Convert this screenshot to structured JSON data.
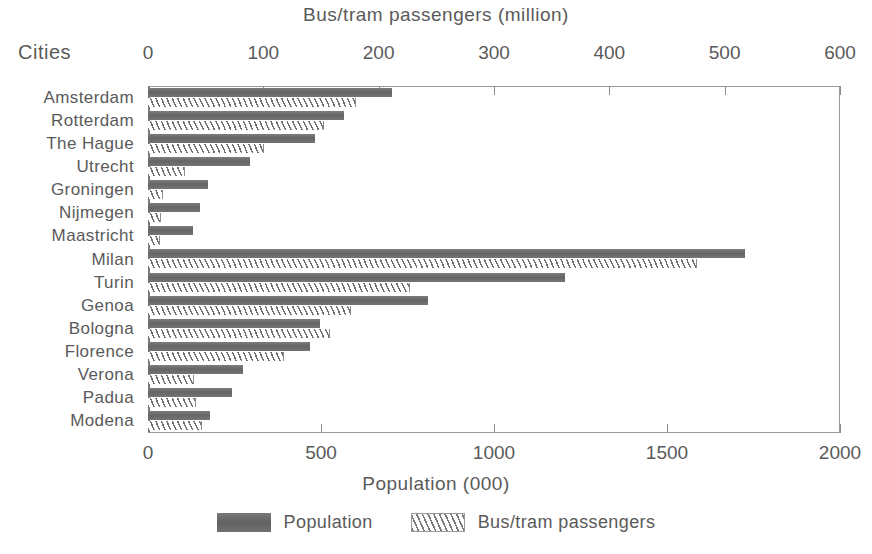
{
  "chart_data": {
    "type": "bar",
    "orientation": "horizontal",
    "title": "Bus/tram passengers (million)",
    "xlabel": "Population (000)",
    "ylabel": "Cities",
    "top_axis": {
      "label": "Bus/tram passengers (million)",
      "ticks": [
        0,
        100,
        200,
        300,
        400,
        500,
        600
      ],
      "tick_labels": [
        "0",
        "100",
        "200",
        "300",
        "400",
        "500",
        "600"
      ],
      "range": [
        0,
        600
      ]
    },
    "bottom_axis": {
      "label": "Population (000)",
      "ticks": [
        0,
        500,
        1000,
        1500,
        2000
      ],
      "tick_labels": [
        "0",
        "500",
        "1000",
        "1500",
        "2000"
      ],
      "range": [
        0,
        2000
      ]
    },
    "categories": [
      "Amsterdam",
      "Rotterdam",
      "The Hague",
      "Utrecht",
      "Groningen",
      "Nijmegen",
      "Maastricht",
      "Milan",
      "Turin",
      "Genoa",
      "Bologna",
      "Florence",
      "Verona",
      "Padua",
      "Modena"
    ],
    "series": [
      {
        "name": "Population",
        "axis": "bottom",
        "unit": "000",
        "color": "#6e6e6e",
        "values": [
          705,
          566,
          483,
          295,
          173,
          150,
          130,
          1725,
          1205,
          809,
          497,
          468,
          275,
          243,
          180
        ]
      },
      {
        "name": "Bus/tram passengers",
        "axis": "top",
        "unit": "million",
        "color": "#ffffff",
        "pattern": "diagonal-hatch",
        "values": [
          180,
          153,
          101,
          32,
          13,
          11,
          10,
          476,
          227,
          176,
          158,
          118,
          40,
          42,
          47
        ]
      }
    ],
    "grid": false,
    "legend_position": "bottom"
  },
  "legend": {
    "items": [
      {
        "label": "Population",
        "swatch": "solid-gray"
      },
      {
        "label": "Bus/tram passengers",
        "swatch": "hatched"
      }
    ]
  }
}
